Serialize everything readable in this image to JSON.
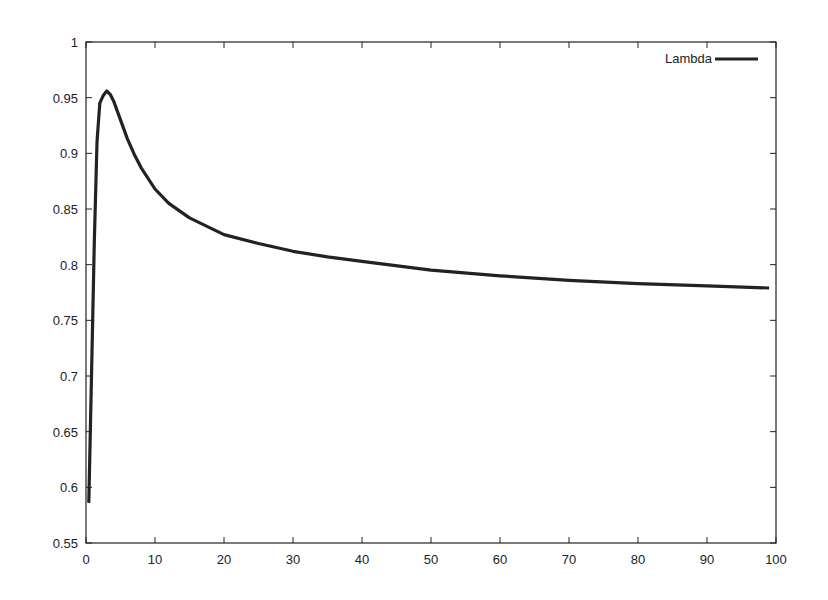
{
  "chart_data": {
    "type": "line",
    "title": "",
    "xlabel": "",
    "ylabel": "",
    "xlim": [
      0,
      100
    ],
    "ylim": [
      0.55,
      1.0
    ],
    "grid": false,
    "legend_position": "top-right",
    "x_ticks": [
      "0",
      "10",
      "20",
      "30",
      "40",
      "50",
      "60",
      "70",
      "80",
      "90",
      "100"
    ],
    "y_ticks": [
      "0.55",
      "0.6",
      "0.65",
      "0.7",
      "0.75",
      "0.8",
      "0.85",
      "0.9",
      "0.95",
      "1"
    ],
    "series": [
      {
        "name": "Lambda",
        "color": "#222222",
        "x": [
          0.4,
          0.8,
          1.2,
          1.6,
          2.0,
          2.5,
          3.0,
          3.5,
          4,
          5,
          6,
          7,
          8,
          10,
          12,
          15,
          20,
          25,
          30,
          35,
          40,
          50,
          60,
          70,
          80,
          90,
          99
        ],
        "y": [
          0.586,
          0.7,
          0.82,
          0.91,
          0.945,
          0.952,
          0.956,
          0.953,
          0.947,
          0.93,
          0.913,
          0.899,
          0.887,
          0.868,
          0.855,
          0.842,
          0.827,
          0.819,
          0.812,
          0.807,
          0.803,
          0.795,
          0.79,
          0.786,
          0.783,
          0.781,
          0.779
        ]
      }
    ]
  }
}
